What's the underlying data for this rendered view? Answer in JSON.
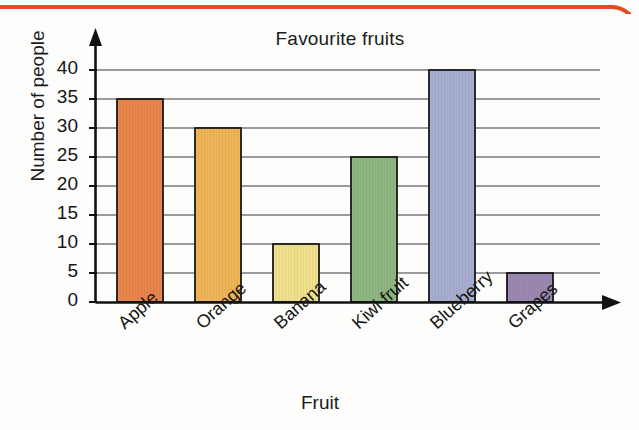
{
  "page": {
    "background_color": "#fdfdfb",
    "border_color": "#e8491f"
  },
  "chart_data": {
    "type": "bar",
    "title": "Favourite fruits",
    "xlabel": "Fruit",
    "ylabel": "Number of people",
    "categories": [
      "Apple",
      "Orange",
      "Banana",
      "Kiwi fruit",
      "Blueberry",
      "Grapes"
    ],
    "values": [
      35,
      30,
      10,
      25,
      40,
      5
    ],
    "bar_colors": [
      "#e8854c",
      "#edb458",
      "#efe08c",
      "#8fb681",
      "#a6adce",
      "#9b88b0"
    ],
    "ylim": [
      0,
      40
    ],
    "ytick_step": 5,
    "ytick_labels": [
      "0",
      "5",
      "10",
      "15",
      "20",
      "25",
      "30",
      "35",
      "40"
    ],
    "grid": "horizontal",
    "legend": "none",
    "axis_style": "arrow-tipped",
    "xlabel_rotation_deg": -42
  },
  "axes": {
    "y_title": "Number of people",
    "x_title": "Fruit",
    "chart_title": "Favourite fruits"
  },
  "icons": {
    "y_axis_arrow": "arrow-up-icon",
    "x_axis_arrow": "arrow-right-icon"
  }
}
